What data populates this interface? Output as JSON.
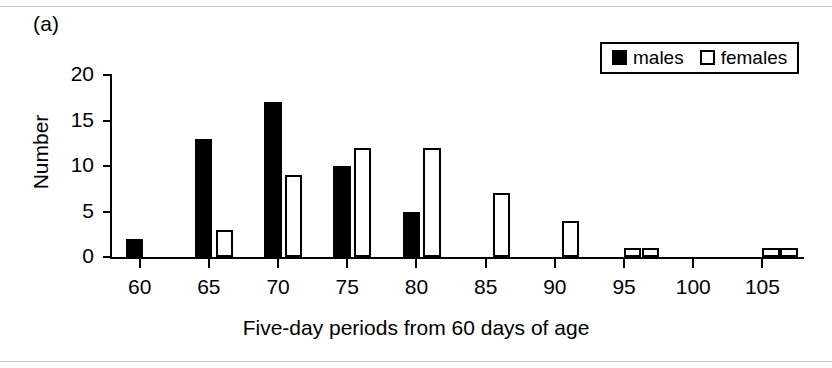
{
  "figure": {
    "panel_label": "(a)"
  },
  "legend": {
    "position": "top-right",
    "entries": [
      {
        "label": "males",
        "swatch": "filled-square-icon",
        "color": "#000000"
      },
      {
        "label": "females",
        "swatch": "open-square-icon",
        "color": "#ffffff"
      }
    ]
  },
  "chart_data": {
    "type": "bar",
    "title": "",
    "subtitle": "",
    "xlabel": "Five-day periods from 60 days of age",
    "ylabel": "Number",
    "grid": false,
    "legend_position": "top-right",
    "xlim": [
      58,
      108
    ],
    "ylim": [
      0,
      20
    ],
    "ytick_labels": [
      "0",
      "5",
      "10",
      "15",
      "20"
    ],
    "yticks": [
      0,
      5,
      10,
      15,
      20
    ],
    "xtick_labels": [
      "60",
      "65",
      "70",
      "75",
      "80",
      "85",
      "90",
      "95",
      "100",
      "105"
    ],
    "xticks": [
      60,
      65,
      70,
      75,
      80,
      85,
      90,
      95,
      100,
      105
    ],
    "categories": [
      60,
      65,
      70,
      75,
      80,
      85,
      90,
      95,
      100,
      105
    ],
    "series": [
      {
        "name": "males",
        "values": [
          2,
          13,
          17,
          10,
          5,
          0,
          0,
          0,
          0,
          0
        ]
      },
      {
        "name": "females",
        "values": [
          0,
          3,
          9,
          12,
          12,
          7,
          4,
          1,
          0,
          1
        ]
      }
    ],
    "bars": [
      {
        "series": "males",
        "bin_start": 59,
        "value": 2
      },
      {
        "series": "males",
        "bin_start": 64,
        "value": 13
      },
      {
        "series": "females",
        "bin_start": 65.5,
        "value": 3
      },
      {
        "series": "males",
        "bin_start": 69,
        "value": 17
      },
      {
        "series": "females",
        "bin_start": 70.5,
        "value": 9
      },
      {
        "series": "males",
        "bin_start": 74,
        "value": 10
      },
      {
        "series": "females",
        "bin_start": 75.5,
        "value": 12
      },
      {
        "series": "males",
        "bin_start": 79,
        "value": 5
      },
      {
        "series": "females",
        "bin_start": 80.5,
        "value": 12
      },
      {
        "series": "females",
        "bin_start": 85.5,
        "value": 7
      },
      {
        "series": "females",
        "bin_start": 90.5,
        "value": 4
      },
      {
        "series": "females",
        "bin_start": 95,
        "value": 1
      },
      {
        "series": "females",
        "bin_start": 96.3,
        "value": 1
      },
      {
        "series": "females",
        "bin_start": 105,
        "value": 1
      },
      {
        "series": "females",
        "bin_start": 106.3,
        "value": 1
      }
    ]
  }
}
